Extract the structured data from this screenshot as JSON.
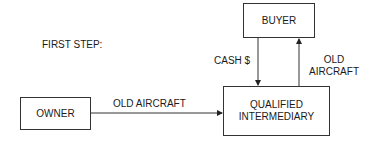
{
  "diagram": {
    "step_label": "FIRST STEP:",
    "nodes": {
      "buyer": "BUYER",
      "qualified_intermediary_line1": "QUALIFIED",
      "qualified_intermediary_line2": "INTERMEDIARY",
      "owner": "OWNER"
    },
    "edges": {
      "buyer_to_qi": "CASH $",
      "qi_to_buyer_line1": "OLD",
      "qi_to_buyer_line2": "AIRCRAFT",
      "owner_to_qi": "OLD AIRCRAFT"
    },
    "colors": {
      "stroke": "#333333",
      "text": "#1a1a1a",
      "background": "#ffffff"
    }
  }
}
